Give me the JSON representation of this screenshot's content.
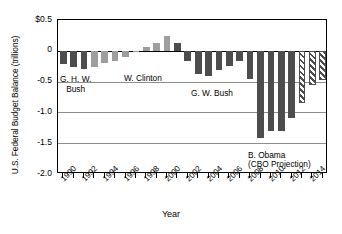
{
  "chart_data": {
    "type": "bar",
    "title": "",
    "xlabel": "Year",
    "ylabel": "U.S. Federal Budget Balance (trillions)",
    "ylim": [
      -2.0,
      0.5
    ],
    "ytick_labels": [
      "$0.5",
      "0",
      "-0.5",
      "-1.0",
      "-1.5",
      "-2.0"
    ],
    "ytick_values": [
      0.5,
      0,
      -0.5,
      -1.0,
      -1.5,
      -2.0
    ],
    "xtick_labels": [
      "1990",
      "1992",
      "1994",
      "1996",
      "1998",
      "2000",
      "2002",
      "2004",
      "2006",
      "2008",
      "2010",
      "2012",
      "2014"
    ],
    "grid": true,
    "legend_position": "none",
    "categories": [
      1990,
      1991,
      1992,
      1993,
      1994,
      1995,
      1996,
      1997,
      1998,
      1999,
      2000,
      2001,
      2002,
      2003,
      2004,
      2005,
      2006,
      2007,
      2008,
      2009,
      2010,
      2011,
      2012,
      2013,
      2014,
      2015
    ],
    "values": [
      -0.221,
      -0.269,
      -0.29,
      -0.255,
      -0.203,
      -0.164,
      -0.107,
      -0.022,
      0.069,
      0.126,
      0.236,
      0.128,
      -0.158,
      -0.378,
      -0.413,
      -0.318,
      -0.248,
      -0.161,
      -0.459,
      -1.413,
      -1.294,
      -1.3,
      -1.087,
      -0.845,
      -0.561,
      -0.478
    ],
    "series": [
      {
        "name": "Actual",
        "values": [
          -0.221,
          -0.269,
          -0.29,
          -0.255,
          -0.203,
          -0.164,
          -0.107,
          -0.022,
          0.069,
          0.126,
          0.236,
          0.128,
          -0.158,
          -0.378,
          -0.413,
          -0.318,
          -0.248,
          -0.161,
          -0.459,
          -1.413,
          -1.294,
          -1.3,
          -1.087,
          null,
          null,
          null
        ]
      },
      {
        "name": "CBO Projection",
        "values": [
          null,
          null,
          null,
          null,
          null,
          null,
          null,
          null,
          null,
          null,
          null,
          null,
          null,
          null,
          null,
          null,
          null,
          null,
          null,
          null,
          null,
          null,
          null,
          -0.845,
          -0.561,
          -0.478
        ]
      }
    ],
    "bar_styles": [
      "dark",
      "dark",
      "dark",
      "light",
      "light",
      "light",
      "light",
      "light",
      "light",
      "light",
      "light",
      "dark",
      "dark",
      "dark",
      "dark",
      "dark",
      "dark",
      "dark",
      "dark",
      "dark",
      "dark",
      "dark",
      "dark",
      "hatch",
      "hatch",
      "hatch"
    ],
    "annotations": [
      {
        "id": "ghw-bush",
        "text_line1": "G. H. W.",
        "text_line2": "Bush"
      },
      {
        "id": "clinton",
        "text_line1": "W. Clinton",
        "text_line2": ""
      },
      {
        "id": "gw-bush",
        "text_line1": "G. W. Bush",
        "text_line2": ""
      },
      {
        "id": "obama",
        "text_line1": "B. Obama",
        "text_line2": "(CBO Projection)"
      }
    ],
    "colors": {
      "bar_dark": "#4d4d4d",
      "bar_light": "#9e9e9e",
      "hatch_base": "#ffffff",
      "hatch_stripe": "#4d4d4d",
      "axis": "#000000",
      "gridline": "#8c8c8c",
      "background": "#ffffff"
    }
  }
}
